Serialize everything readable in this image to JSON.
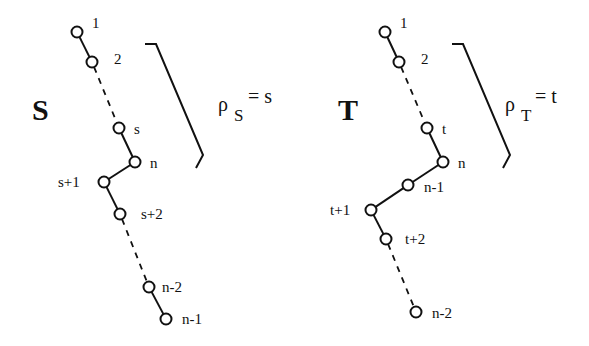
{
  "figure": {
    "colors": {
      "stroke": "#111111",
      "background": "#ffffff"
    }
  },
  "trees": [
    {
      "name": "S",
      "rho_symbol": "ρ",
      "rho_subscript": "S",
      "rho_value": "= s",
      "nodes": [
        {
          "id": "1",
          "label": "1",
          "x": 77,
          "y": 32,
          "lx": 92,
          "ly": 28
        },
        {
          "id": "2",
          "label": "2",
          "x": 92,
          "y": 62,
          "lx": 114,
          "ly": 64
        },
        {
          "id": "s",
          "label": "s",
          "x": 119,
          "y": 128,
          "lx": 134,
          "ly": 134
        },
        {
          "id": "n",
          "label": "n",
          "x": 135,
          "y": 162,
          "lx": 150,
          "ly": 168
        },
        {
          "id": "s+1",
          "label": "s+1",
          "x": 104,
          "y": 182,
          "lx": 58,
          "ly": 187
        },
        {
          "id": "s+2",
          "label": "s+2",
          "x": 120,
          "y": 214,
          "lx": 141,
          "ly": 219
        },
        {
          "id": "n-2",
          "label": "n-2",
          "x": 149,
          "y": 287,
          "lx": 162,
          "ly": 292
        },
        {
          "id": "n-1",
          "label": "n-1",
          "x": 166,
          "y": 319,
          "lx": 182,
          "ly": 324
        }
      ],
      "edges": [
        {
          "from": "1",
          "to": "2",
          "style": "solid"
        },
        {
          "from": "2",
          "to": "s",
          "style": "dashed"
        },
        {
          "from": "s",
          "to": "n",
          "style": "solid"
        },
        {
          "from": "n",
          "to": "s+1",
          "style": "solid"
        },
        {
          "from": "s+1",
          "to": "s+2",
          "style": "solid"
        },
        {
          "from": "s+2",
          "to": "n-2",
          "style": "dashed"
        },
        {
          "from": "n-2",
          "to": "n-1",
          "style": "solid"
        }
      ]
    },
    {
      "name": "T",
      "rho_symbol": "ρ",
      "rho_subscript": "T",
      "rho_value": "= t",
      "nodes": [
        {
          "id": "1",
          "label": "1",
          "x": 385,
          "y": 32,
          "lx": 400,
          "ly": 28
        },
        {
          "id": "2",
          "label": "2",
          "x": 399,
          "y": 62,
          "lx": 421,
          "ly": 64
        },
        {
          "id": "t",
          "label": "t",
          "x": 427,
          "y": 128,
          "lx": 442,
          "ly": 134
        },
        {
          "id": "n",
          "label": "n",
          "x": 443,
          "y": 162,
          "lx": 458,
          "ly": 168
        },
        {
          "id": "n-1",
          "label": "n-1",
          "x": 408,
          "y": 185,
          "lx": 424,
          "ly": 192
        },
        {
          "id": "t+1",
          "label": "t+1",
          "x": 371,
          "y": 210,
          "lx": 330,
          "ly": 215
        },
        {
          "id": "t+2",
          "label": "t+2",
          "x": 386,
          "y": 239,
          "lx": 405,
          "ly": 244
        },
        {
          "id": "n-2",
          "label": "n-2",
          "x": 416,
          "y": 312,
          "lx": 432,
          "ly": 318
        }
      ],
      "edges": [
        {
          "from": "1",
          "to": "2",
          "style": "solid"
        },
        {
          "from": "2",
          "to": "t",
          "style": "dashed"
        },
        {
          "from": "t",
          "to": "n",
          "style": "solid"
        },
        {
          "from": "n",
          "to": "n-1",
          "style": "solid"
        },
        {
          "from": "n-1",
          "to": "t+1",
          "style": "solid"
        },
        {
          "from": "t+1",
          "to": "t+2",
          "style": "solid"
        },
        {
          "from": "t+2",
          "to": "n-2",
          "style": "dashed"
        }
      ]
    }
  ]
}
